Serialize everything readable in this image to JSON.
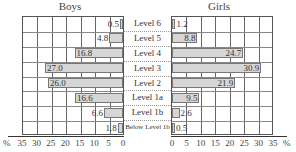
{
  "chart_data": {
    "type": "bar",
    "orientation": "horizontal-butterfly",
    "title_left": "Boys",
    "title_right": "Girls",
    "categories": [
      "Level 6",
      "Level 5",
      "Level 4",
      "Level 3",
      "Level 2",
      "Level 1a",
      "Level 1b",
      "Below Level 1b"
    ],
    "series": [
      {
        "name": "Boys",
        "values": [
          0.5,
          4.8,
          16.8,
          27.0,
          26.0,
          16.6,
          6.6,
          1.8
        ]
      },
      {
        "name": "Girls",
        "values": [
          1.2,
          8.8,
          24.7,
          30.9,
          21.9,
          9.5,
          2.6,
          0.5
        ]
      }
    ],
    "value_labels_boys": [
      "0.5",
      "4.8",
      "16.8",
      "27.0",
      "26.0",
      "16.6",
      "6.6",
      "1.8"
    ],
    "value_labels_girls": [
      "1.2",
      "8.8",
      "24.7",
      "30.9",
      "21.9",
      "9.5",
      "2.6",
      "0.5"
    ],
    "xlabel": "%",
    "xlim": [
      0,
      35
    ],
    "xticks_left": [
      "35",
      "30",
      "25",
      "20",
      "15",
      "10",
      "5",
      "0"
    ],
    "xticks_right": [
      "0",
      "5",
      "10",
      "15",
      "20",
      "25",
      "30",
      "35"
    ],
    "grid": true,
    "bar_color": "#d6d6d6"
  },
  "labels": {
    "boys": "Boys",
    "girls": "Girls",
    "pct_left": "%",
    "pct_right": "%"
  }
}
